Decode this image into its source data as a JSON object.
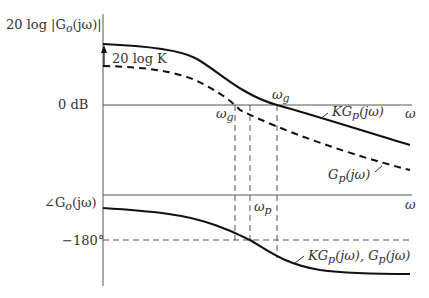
{
  "diagram": {
    "type": "bode_plot",
    "magnitude_plot": {
      "ylabel": "20 log |G_o(jω)|",
      "zero_line_label": "0 dB",
      "x_axis_label": "ω",
      "gain_annotation": "20 log K",
      "curves": [
        {
          "name": "KG_p(jω)",
          "style": "solid",
          "label": "KG_p(jω)"
        },
        {
          "name": "G_p(jω)",
          "style": "dashed",
          "label": "G_p(jω)"
        }
      ],
      "crossover_labels": [
        {
          "label": "ω_g",
          "curve": "G_p(jω)"
        },
        {
          "label": "ω_g",
          "curve": "KG_p(jω)"
        }
      ]
    },
    "phase_plot": {
      "ylabel": "∠G_o(jω)",
      "reference_label": "−180°",
      "x_axis_label": "ω",
      "phase_crossover_label": "ω_p",
      "curves": [
        {
          "name": "KG_p(jω), G_p(jω)",
          "style": "solid",
          "label": "KG_p(jω), G_p(jω)"
        }
      ]
    }
  },
  "labels": {
    "mag_ylabel": "20 log |G",
    "mag_ylabel_sub": "o",
    "mag_ylabel_tail": "(jω)|",
    "zero_db": "0 dB",
    "gain_K": "20 log K",
    "omega": "ω",
    "omega_g": "ω",
    "omega_g_sub": "g",
    "omega_p": "ω",
    "omega_p_sub": "p",
    "kgp": "KG",
    "kgp_sub": "p",
    "kgp_tail": "(jω)",
    "gp": "G",
    "gp_sub": "p",
    "gp_tail": "(jω)",
    "phase_ylabel": "∠G",
    "phase_ylabel_sub": "o",
    "phase_ylabel_tail": "(jω)",
    "minus180": "−180°",
    "phase_curve": "KG",
    "phase_curve_sub": "p",
    "phase_curve_mid": "(jω), G",
    "phase_curve_sub2": "p",
    "phase_curve_tail": "(jω)"
  }
}
